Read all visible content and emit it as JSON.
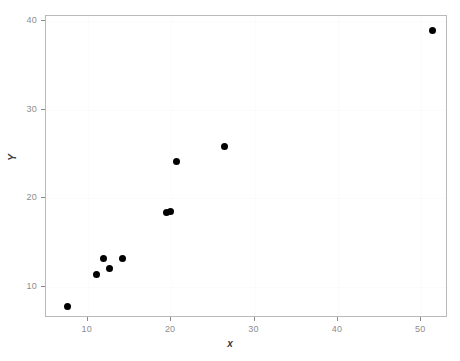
{
  "chart_data": {
    "type": "scatter",
    "title": "",
    "xlabel": "x",
    "ylabel": "Y",
    "xlim": [
      5.0,
      53.2
    ],
    "ylim": [
      6.5,
      40.6
    ],
    "xticks": [
      10,
      20,
      30,
      40,
      50
    ],
    "yticks": [
      10,
      20,
      30,
      40
    ],
    "xticklabels": [
      "10",
      "20",
      "30",
      "40",
      "50"
    ],
    "yticklabels": [
      "10",
      "20",
      "30",
      "40"
    ],
    "grid": true,
    "legend": null,
    "marker": "filled-circle",
    "marker_color": "#000000",
    "marker_size": 7,
    "points": [
      {
        "x": 7.6,
        "y": 7.8
      },
      {
        "x": 11.0,
        "y": 11.4
      },
      {
        "x": 11.9,
        "y": 13.2
      },
      {
        "x": 12.6,
        "y": 12.1
      },
      {
        "x": 14.2,
        "y": 13.2
      },
      {
        "x": 19.5,
        "y": 18.4
      },
      {
        "x": 19.9,
        "y": 18.5
      },
      {
        "x": 20.7,
        "y": 24.2
      },
      {
        "x": 26.4,
        "y": 25.9
      },
      {
        "x": 51.4,
        "y": 39.0
      }
    ]
  },
  "figure": {
    "background": "#ffffff",
    "panel_border_color": "#b9b9b9",
    "gridline_color": "#fbfbfb",
    "tick_color": "#8a8a8a",
    "tick_label_color": "#8d8d8d",
    "axis_title_color": "#3b3b3b"
  }
}
